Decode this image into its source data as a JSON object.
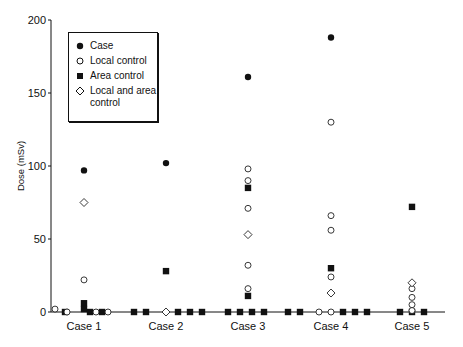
{
  "chart_data": {
    "type": "scatter",
    "title": "",
    "xlabel": "",
    "ylabel": "Dose (mSv)",
    "ylim": [
      0,
      200
    ],
    "yticks": [
      0,
      50,
      100,
      150,
      200
    ],
    "categories": [
      "Case 1",
      "Case 2",
      "Case 3",
      "Case 4",
      "Case 5"
    ],
    "grid": false,
    "legend_position": "upper-left",
    "legend": [
      {
        "name": "Case",
        "marker": "filled-circle"
      },
      {
        "name": "Local control",
        "marker": "open-circle"
      },
      {
        "name": "Area control",
        "marker": "filled-square"
      },
      {
        "name": "Local and area control",
        "marker": "open-diamond"
      }
    ],
    "series": [
      {
        "name": "Case",
        "marker": "filled-circle",
        "points": [
          {
            "category": "Case 1",
            "value": 97
          },
          {
            "category": "Case 2",
            "value": 102
          },
          {
            "category": "Case 3",
            "value": 161
          },
          {
            "category": "Case 4",
            "value": 188
          }
        ]
      },
      {
        "name": "Local control",
        "marker": "open-circle",
        "points": [
          {
            "category": "Case 1",
            "value": 22
          },
          {
            "category": "Case 1",
            "value": 2,
            "offset": -29
          },
          {
            "category": "Case 1",
            "value": 0,
            "offset": -17
          },
          {
            "category": "Case 1",
            "value": 0,
            "offset": 12
          },
          {
            "category": "Case 1",
            "value": 0,
            "offset": 24
          },
          {
            "category": "Case 3",
            "value": 98
          },
          {
            "category": "Case 3",
            "value": 90
          },
          {
            "category": "Case 3",
            "value": 71
          },
          {
            "category": "Case 3",
            "value": 32
          },
          {
            "category": "Case 3",
            "value": 16
          },
          {
            "category": "Case 4",
            "value": 130
          },
          {
            "category": "Case 4",
            "value": 66
          },
          {
            "category": "Case 4",
            "value": 56
          },
          {
            "category": "Case 4",
            "value": 24
          },
          {
            "category": "Case 4",
            "value": 0,
            "offset": -12
          },
          {
            "category": "Case 4",
            "value": 0,
            "offset": 0
          },
          {
            "category": "Case 5",
            "value": 16
          },
          {
            "category": "Case 5",
            "value": 10
          },
          {
            "category": "Case 5",
            "value": 5
          },
          {
            "category": "Case 5",
            "value": 1
          }
        ]
      },
      {
        "name": "Area control",
        "marker": "filled-square",
        "points": [
          {
            "category": "Case 1",
            "value": 6
          },
          {
            "category": "Case 1",
            "value": 2
          },
          {
            "category": "Case 1",
            "value": 0,
            "offset": -19
          },
          {
            "category": "Case 1",
            "value": 0,
            "offset": 6
          },
          {
            "category": "Case 1",
            "value": 0,
            "offset": 18
          },
          {
            "category": "Case 2",
            "value": 28
          },
          {
            "category": "Case 2",
            "value": 0,
            "offset": -32
          },
          {
            "category": "Case 2",
            "value": 0,
            "offset": -20
          },
          {
            "category": "Case 2",
            "value": 0,
            "offset": 12
          },
          {
            "category": "Case 2",
            "value": 0,
            "offset": 24
          },
          {
            "category": "Case 2",
            "value": 0,
            "offset": 36
          },
          {
            "category": "Case 3",
            "value": 85
          },
          {
            "category": "Case 3",
            "value": 11
          },
          {
            "category": "Case 3",
            "value": 0,
            "offset": -20
          },
          {
            "category": "Case 3",
            "value": 0,
            "offset": -8
          },
          {
            "category": "Case 3",
            "value": 0,
            "offset": 4
          },
          {
            "category": "Case 3",
            "value": 0,
            "offset": 16
          },
          {
            "category": "Case 4",
            "value": 30
          },
          {
            "category": "Case 4",
            "value": 0,
            "offset": -43
          },
          {
            "category": "Case 4",
            "value": 0,
            "offset": -31
          },
          {
            "category": "Case 4",
            "value": 0,
            "offset": 12
          },
          {
            "category": "Case 4",
            "value": 0,
            "offset": 24
          },
          {
            "category": "Case 4",
            "value": 0,
            "offset": 36
          },
          {
            "category": "Case 5",
            "value": 72
          },
          {
            "category": "Case 5",
            "value": 0,
            "offset": -12
          },
          {
            "category": "Case 5",
            "value": 0,
            "offset": 0
          },
          {
            "category": "Case 5",
            "value": 0,
            "offset": 12
          }
        ]
      },
      {
        "name": "Local and area control",
        "marker": "open-diamond",
        "points": [
          {
            "category": "Case 1",
            "value": 75
          },
          {
            "category": "Case 2",
            "value": 0
          },
          {
            "category": "Case 3",
            "value": 53
          },
          {
            "category": "Case 4",
            "value": 13
          },
          {
            "category": "Case 5",
            "value": 20
          }
        ]
      }
    ]
  },
  "legend": {
    "items": [
      "Case",
      "Local control",
      "Area control",
      "Local and area control"
    ]
  }
}
